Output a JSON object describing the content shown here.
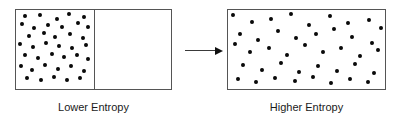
{
  "figure": {
    "background_color": "#ffffff",
    "dot_color": "#0a0a0a",
    "border_color": "#555555",
    "arrow_color": "#111111",
    "text_color": "#1a1a1a",
    "width": 398,
    "height": 118
  },
  "left_panel": {
    "caption": "Lower Entropy",
    "box": {
      "x": 15,
      "y": 9,
      "width": 157,
      "height": 81
    },
    "divider_x": 94,
    "dot_radius": 1.9,
    "dot_count": 33,
    "dots": [
      [
        25,
        16
      ],
      [
        40,
        15
      ],
      [
        57,
        19
      ],
      [
        69,
        14
      ],
      [
        84,
        17
      ],
      [
        22,
        24
      ],
      [
        34,
        28
      ],
      [
        48,
        25
      ],
      [
        62,
        27
      ],
      [
        78,
        23
      ],
      [
        88,
        27
      ],
      [
        29,
        36
      ],
      [
        44,
        33
      ],
      [
        55,
        37
      ],
      [
        70,
        34
      ],
      [
        83,
        38
      ],
      [
        20,
        44
      ],
      [
        33,
        47
      ],
      [
        46,
        43
      ],
      [
        59,
        46
      ],
      [
        72,
        48
      ],
      [
        86,
        45
      ],
      [
        25,
        55
      ],
      [
        38,
        58
      ],
      [
        52,
        54
      ],
      [
        64,
        57
      ],
      [
        77,
        55
      ],
      [
        88,
        59
      ],
      [
        21,
        66
      ],
      [
        32,
        70
      ],
      [
        45,
        65
      ],
      [
        58,
        69
      ],
      [
        71,
        66
      ],
      [
        84,
        71
      ],
      [
        27,
        78
      ],
      [
        41,
        80
      ],
      [
        54,
        77
      ],
      [
        67,
        80
      ],
      [
        80,
        78
      ]
    ]
  },
  "arrow": {
    "name": "process-arrow",
    "x1": 185,
    "x2": 222,
    "y": 50,
    "direction": "right"
  },
  "right_panel": {
    "caption": "Higher Entropy",
    "box": {
      "x": 227,
      "y": 9,
      "width": 159,
      "height": 81
    },
    "dot_radius": 1.9,
    "dot_count": 31,
    "dots": [
      [
        233,
        15
      ],
      [
        252,
        22
      ],
      [
        271,
        19
      ],
      [
        291,
        14
      ],
      [
        309,
        25
      ],
      [
        330,
        16
      ],
      [
        348,
        23
      ],
      [
        369,
        20
      ],
      [
        381,
        28
      ],
      [
        240,
        34
      ],
      [
        258,
        40
      ],
      [
        278,
        31
      ],
      [
        296,
        38
      ],
      [
        316,
        34
      ],
      [
        334,
        29
      ],
      [
        352,
        37
      ],
      [
        372,
        43
      ],
      [
        235,
        44
      ],
      [
        250,
        52
      ],
      [
        269,
        48
      ],
      [
        287,
        55
      ],
      [
        305,
        45
      ],
      [
        323,
        52
      ],
      [
        341,
        48
      ],
      [
        360,
        56
      ],
      [
        378,
        50
      ],
      [
        243,
        65
      ],
      [
        262,
        70
      ],
      [
        281,
        63
      ],
      [
        299,
        72
      ],
      [
        318,
        66
      ],
      [
        337,
        71
      ],
      [
        355,
        64
      ],
      [
        374,
        73
      ],
      [
        238,
        79
      ],
      [
        256,
        82
      ],
      [
        275,
        78
      ],
      [
        295,
        81
      ],
      [
        313,
        77
      ],
      [
        331,
        83
      ],
      [
        350,
        79
      ],
      [
        368,
        82
      ]
    ]
  }
}
